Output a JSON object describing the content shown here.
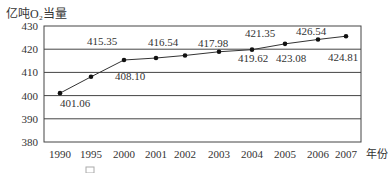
{
  "chart_data": {
    "type": "line",
    "title": "",
    "ylabel": "亿吨O₂当量",
    "xlabel": "年份",
    "categories": [
      "1990",
      "1995",
      "2000",
      "2001",
      "2002",
      "2003",
      "2004",
      "2005",
      "2006",
      "2007"
    ],
    "values": [
      401.06,
      408.1,
      415.35,
      416.54,
      417.98,
      419.62,
      421.35,
      423.08,
      424.81,
      426.54
    ],
    "point_labels": [
      "401.06",
      "408.10",
      "415.35",
      "416.54",
      "417.98",
      "419.62",
      "421.35",
      "423.08",
      "424.81",
      "426.54"
    ],
    "label_positions": [
      {
        "year": "1990",
        "text": "401.06",
        "x": 60,
        "y": 107
      },
      {
        "year": "1995",
        "text": "408.10",
        "x": 115,
        "y": 80
      },
      {
        "year": "2000",
        "text": "415.35",
        "x": 87,
        "y": 45
      },
      {
        "year": "2001",
        "text": "416.54",
        "x": 148,
        "y": 46
      },
      {
        "year": "2003",
        "text": "417.98",
        "x": 198,
        "y": 47
      },
      {
        "year": "2004",
        "text": "419.62",
        "x": 238,
        "y": 62
      },
      {
        "year": "2004b",
        "text": "421.35",
        "x": 245,
        "y": 37
      },
      {
        "year": "2005",
        "text": "423.08",
        "x": 276,
        "y": 62
      },
      {
        "year": "2006",
        "text": "426.54",
        "x": 296,
        "y": 35
      },
      {
        "year": "2007",
        "text": "424.81",
        "x": 328,
        "y": 61
      }
    ],
    "ylim": [
      380,
      430
    ],
    "yticks": [
      380,
      390,
      400,
      410,
      420,
      430
    ],
    "grid": true,
    "legend": null
  },
  "caption_partial": "图"
}
